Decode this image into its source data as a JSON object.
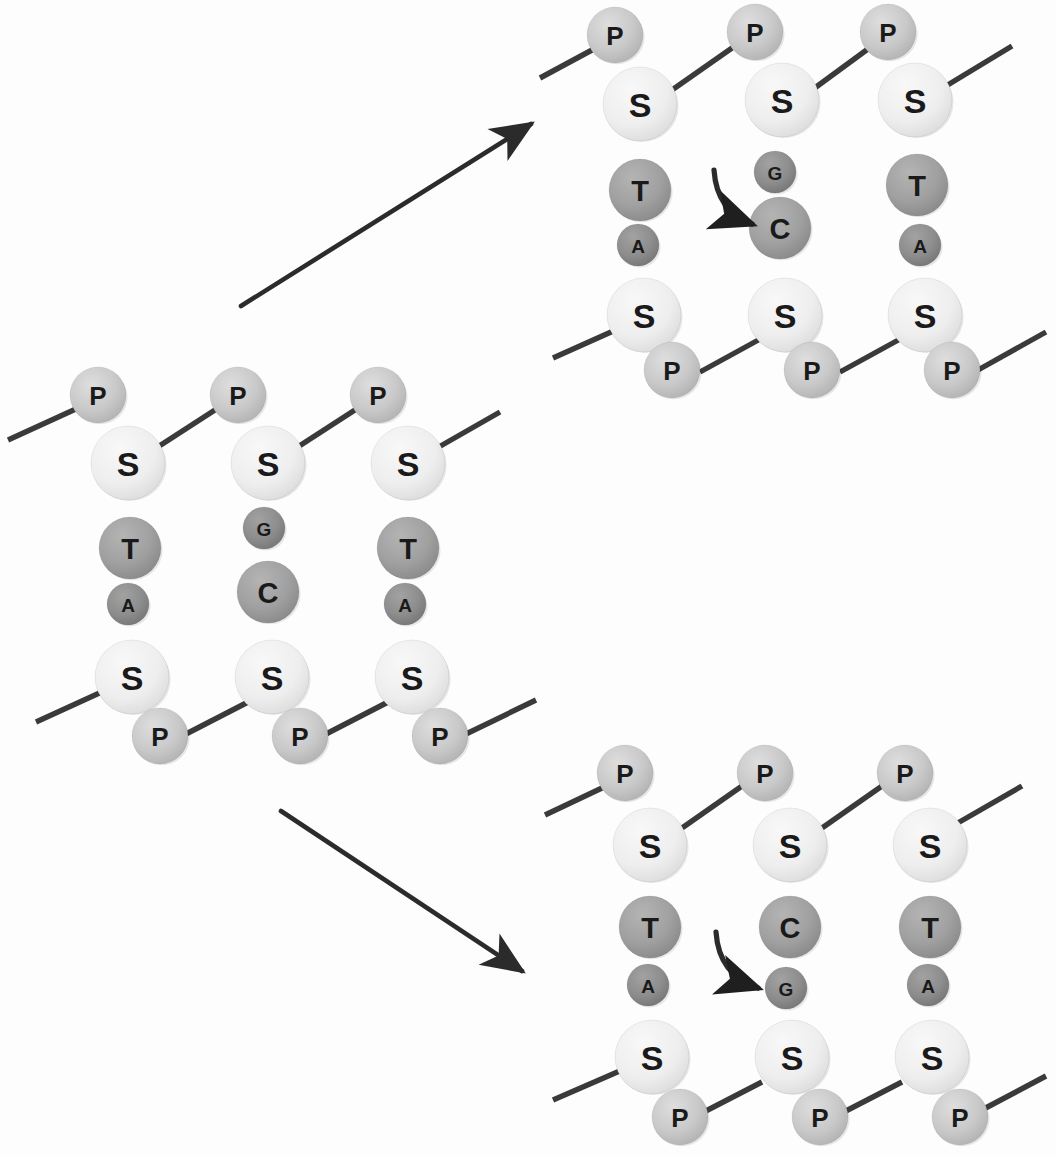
{
  "diagram": {
    "background_color": "#fdfdfd",
    "legend_meaning": {
      "P": "phosphate",
      "S": "sugar (deoxyribose)",
      "A": "adenine",
      "T": "thymine",
      "C": "cytosine",
      "G": "guanine"
    }
  },
  "palette": {
    "phosphate": "#c9c9c9",
    "sugar": "#eeeeee",
    "base_large": "#a0a0a0",
    "base_small": "#8d8d8d",
    "backbone_line": "#3a3a3a",
    "arrow": "#2b2b2b",
    "label_text": "#1a1a1a",
    "circle_outline": "#d8d8d8"
  },
  "geometry": {
    "column_spacing": 140,
    "radius_phosphate": 28,
    "radius_sugar": 37,
    "radius_base_large": 31,
    "radius_base_small": 21
  },
  "labels": {
    "phosphate": "P",
    "sugar": "S",
    "adenine": "A",
    "thymine": "T",
    "cytosine": "C",
    "guanine": "G"
  },
  "structures": [
    {
      "id": "parent",
      "name": "parent-dna-segment",
      "position_note": "left-center",
      "origin": {
        "x": 0,
        "y": 360
      },
      "top_backbone": [
        {
          "from": [
            8,
            440
          ],
          "to": [
            78,
            408
          ]
        },
        {
          "from": [
            150,
            452
          ],
          "to": [
            218,
            408
          ]
        },
        {
          "from": [
            290,
            452
          ],
          "to": [
            358,
            408
          ]
        },
        {
          "from": [
            430,
            452
          ],
          "to": [
            500,
            412
          ]
        }
      ],
      "bottom_backbone": [
        {
          "from": [
            36,
            722
          ],
          "to": [
            106,
            690
          ]
        },
        {
          "from": [
            186,
            734
          ],
          "to": [
            252,
            700
          ]
        },
        {
          "from": [
            326,
            734
          ],
          "to": [
            392,
            700
          ]
        },
        {
          "from": [
            466,
            734
          ],
          "to": [
            536,
            700
          ]
        }
      ],
      "columns": [
        {
          "index": 0,
          "nodes": [
            {
              "type": "phosphate",
              "label": "P",
              "cx": 98,
              "cy": 395,
              "r": 28
            },
            {
              "type": "sugar",
              "label": "S",
              "cx": 128,
              "cy": 463,
              "r": 37
            },
            {
              "type": "base_large",
              "label": "T",
              "cx": 130,
              "cy": 548,
              "r": 31
            },
            {
              "type": "base_small",
              "label": "A",
              "cx": 128,
              "cy": 604,
              "r": 21
            },
            {
              "type": "sugar",
              "label": "S",
              "cx": 132,
              "cy": 677,
              "r": 37
            },
            {
              "type": "phosphate",
              "label": "P",
              "cx": 160,
              "cy": 736,
              "r": 28
            }
          ]
        },
        {
          "index": 1,
          "nodes": [
            {
              "type": "phosphate",
              "label": "P",
              "cx": 238,
              "cy": 395,
              "r": 28
            },
            {
              "type": "sugar",
              "label": "S",
              "cx": 268,
              "cy": 463,
              "r": 37
            },
            {
              "type": "base_small",
              "label": "G",
              "cx": 264,
              "cy": 528,
              "r": 21
            },
            {
              "type": "base_large",
              "label": "C",
              "cx": 268,
              "cy": 592,
              "r": 31
            },
            {
              "type": "sugar",
              "label": "S",
              "cx": 272,
              "cy": 677,
              "r": 37
            },
            {
              "type": "phosphate",
              "label": "P",
              "cx": 300,
              "cy": 736,
              "r": 28
            }
          ]
        },
        {
          "index": 2,
          "nodes": [
            {
              "type": "phosphate",
              "label": "P",
              "cx": 378,
              "cy": 395,
              "r": 28
            },
            {
              "type": "sugar",
              "label": "S",
              "cx": 408,
              "cy": 463,
              "r": 37
            },
            {
              "type": "base_large",
              "label": "T",
              "cx": 408,
              "cy": 548,
              "r": 31
            },
            {
              "type": "base_small",
              "label": "A",
              "cx": 405,
              "cy": 604,
              "r": 21
            },
            {
              "type": "sugar",
              "label": "S",
              "cx": 412,
              "cy": 677,
              "r": 37
            },
            {
              "type": "phosphate",
              "label": "P",
              "cx": 440,
              "cy": 736,
              "r": 28
            }
          ]
        }
      ],
      "curved_arrow": null
    },
    {
      "id": "daughter-upper",
      "name": "upper-right-dna-segment",
      "position_note": "top-right",
      "origin": {
        "x": 540,
        "y": 0
      },
      "top_backbone": [
        {
          "from": [
            540,
            78
          ],
          "to": [
            592,
            50
          ]
        },
        {
          "from": [
            672,
            90
          ],
          "to": [
            732,
            48
          ]
        },
        {
          "from": [
            812,
            90
          ],
          "to": [
            872,
            46
          ]
        },
        {
          "from": [
            946,
            86
          ],
          "to": [
            1012,
            46
          ]
        }
      ],
      "bottom_backbone": [
        {
          "from": [
            553,
            358
          ],
          "to": [
            620,
            328
          ]
        },
        {
          "from": [
            700,
            372
          ],
          "to": [
            762,
            338
          ]
        },
        {
          "from": [
            840,
            372
          ],
          "to": [
            902,
            338
          ]
        },
        {
          "from": [
            978,
            370
          ],
          "to": [
            1046,
            332
          ]
        }
      ],
      "columns": [
        {
          "index": 0,
          "nodes": [
            {
              "type": "phosphate",
              "label": "P",
              "cx": 615,
              "cy": 35,
              "r": 28
            },
            {
              "type": "sugar",
              "label": "S",
              "cx": 640,
              "cy": 104,
              "r": 37
            },
            {
              "type": "base_large",
              "label": "T",
              "cx": 640,
              "cy": 190,
              "r": 31
            },
            {
              "type": "base_small",
              "label": "A",
              "cx": 638,
              "cy": 245,
              "r": 21
            },
            {
              "type": "sugar",
              "label": "S",
              "cx": 644,
              "cy": 315,
              "r": 37
            },
            {
              "type": "phosphate",
              "label": "P",
              "cx": 672,
              "cy": 370,
              "r": 28
            }
          ]
        },
        {
          "index": 1,
          "nodes": [
            {
              "type": "phosphate",
              "label": "P",
              "cx": 755,
              "cy": 32,
              "r": 28
            },
            {
              "type": "sugar",
              "label": "S",
              "cx": 782,
              "cy": 100,
              "r": 37
            },
            {
              "type": "base_small",
              "label": "G",
              "cx": 775,
              "cy": 172,
              "r": 21
            },
            {
              "type": "base_large",
              "label": "C",
              "cx": 780,
              "cy": 228,
              "r": 31
            },
            {
              "type": "sugar",
              "label": "S",
              "cx": 785,
              "cy": 315,
              "r": 37
            },
            {
              "type": "phosphate",
              "label": "P",
              "cx": 812,
              "cy": 370,
              "r": 28
            }
          ]
        },
        {
          "index": 2,
          "nodes": [
            {
              "type": "phosphate",
              "label": "P",
              "cx": 888,
              "cy": 32,
              "r": 28
            },
            {
              "type": "sugar",
              "label": "S",
              "cx": 915,
              "cy": 100,
              "r": 37
            },
            {
              "type": "base_large",
              "label": "T",
              "cx": 917,
              "cy": 185,
              "r": 31
            },
            {
              "type": "base_small",
              "label": "A",
              "cx": 920,
              "cy": 245,
              "r": 21
            },
            {
              "type": "sugar",
              "label": "S",
              "cx": 925,
              "cy": 315,
              "r": 37
            },
            {
              "type": "phosphate",
              "label": "P",
              "cx": 952,
              "cy": 370,
              "r": 28
            }
          ]
        }
      ],
      "curved_arrow": {
        "name": "curved-arrow-to-cytosine",
        "path": "M 714 170 C 716 200 730 216 752 224",
        "target_label": "C"
      }
    },
    {
      "id": "daughter-lower",
      "name": "lower-right-dna-segment",
      "position_note": "bottom-right",
      "origin": {
        "x": 540,
        "y": 740
      },
      "top_backbone": [
        {
          "from": [
            545,
            815
          ],
          "to": [
            602,
            788
          ]
        },
        {
          "from": [
            682,
            828
          ],
          "to": [
            742,
            786
          ]
        },
        {
          "from": [
            822,
            828
          ],
          "to": [
            882,
            786
          ]
        },
        {
          "from": [
            956,
            824
          ],
          "to": [
            1022,
            786
          ]
        }
      ],
      "bottom_backbone": [
        {
          "from": [
            553,
            1100
          ],
          "to": [
            622,
            1070
          ]
        },
        {
          "from": [
            700,
            1114
          ],
          "to": [
            762,
            1082
          ]
        },
        {
          "from": [
            840,
            1114
          ],
          "to": [
            902,
            1082
          ]
        },
        {
          "from": [
            978,
            1112
          ],
          "to": [
            1046,
            1076
          ]
        }
      ],
      "columns": [
        {
          "index": 0,
          "nodes": [
            {
              "type": "phosphate",
              "label": "P",
              "cx": 625,
              "cy": 773,
              "r": 28
            },
            {
              "type": "sugar",
              "label": "S",
              "cx": 650,
              "cy": 845,
              "r": 37
            },
            {
              "type": "base_large",
              "label": "T",
              "cx": 650,
              "cy": 927,
              "r": 31
            },
            {
              "type": "base_small",
              "label": "A",
              "cx": 648,
              "cy": 985,
              "r": 21
            },
            {
              "type": "sugar",
              "label": "S",
              "cx": 652,
              "cy": 1057,
              "r": 37
            },
            {
              "type": "phosphate",
              "label": "P",
              "cx": 680,
              "cy": 1117,
              "r": 28
            }
          ]
        },
        {
          "index": 1,
          "nodes": [
            {
              "type": "phosphate",
              "label": "P",
              "cx": 765,
              "cy": 773,
              "r": 28
            },
            {
              "type": "sugar",
              "label": "S",
              "cx": 790,
              "cy": 845,
              "r": 37
            },
            {
              "type": "base_large",
              "label": "C",
              "cx": 790,
              "cy": 927,
              "r": 31
            },
            {
              "type": "base_small",
              "label": "G",
              "cx": 786,
              "cy": 988,
              "r": 21
            },
            {
              "type": "sugar",
              "label": "S",
              "cx": 792,
              "cy": 1057,
              "r": 37
            },
            {
              "type": "phosphate",
              "label": "P",
              "cx": 820,
              "cy": 1117,
              "r": 28
            }
          ]
        },
        {
          "index": 2,
          "nodes": [
            {
              "type": "phosphate",
              "label": "P",
              "cx": 905,
              "cy": 773,
              "r": 28
            },
            {
              "type": "sugar",
              "label": "S",
              "cx": 930,
              "cy": 845,
              "r": 37
            },
            {
              "type": "base_large",
              "label": "T",
              "cx": 930,
              "cy": 927,
              "r": 31
            },
            {
              "type": "base_small",
              "label": "A",
              "cx": 928,
              "cy": 985,
              "r": 21
            },
            {
              "type": "sugar",
              "label": "S",
              "cx": 932,
              "cy": 1057,
              "r": 37
            },
            {
              "type": "phosphate",
              "label": "P",
              "cx": 960,
              "cy": 1117,
              "r": 28
            }
          ]
        }
      ],
      "curved_arrow": {
        "name": "curved-arrow-to-guanine",
        "path": "M 716 932 C 718 962 734 980 758 988",
        "target_label": "G"
      }
    }
  ],
  "transition_arrows": [
    {
      "id": "arrow-up",
      "name": "transition-arrow-upper",
      "from": [
        241,
        306
      ],
      "to": [
        531,
        124
      ],
      "direction": "up-right"
    },
    {
      "id": "arrow-down",
      "name": "transition-arrow-lower",
      "from": [
        281,
        811
      ],
      "to": [
        522,
        971
      ],
      "direction": "down-right"
    }
  ]
}
